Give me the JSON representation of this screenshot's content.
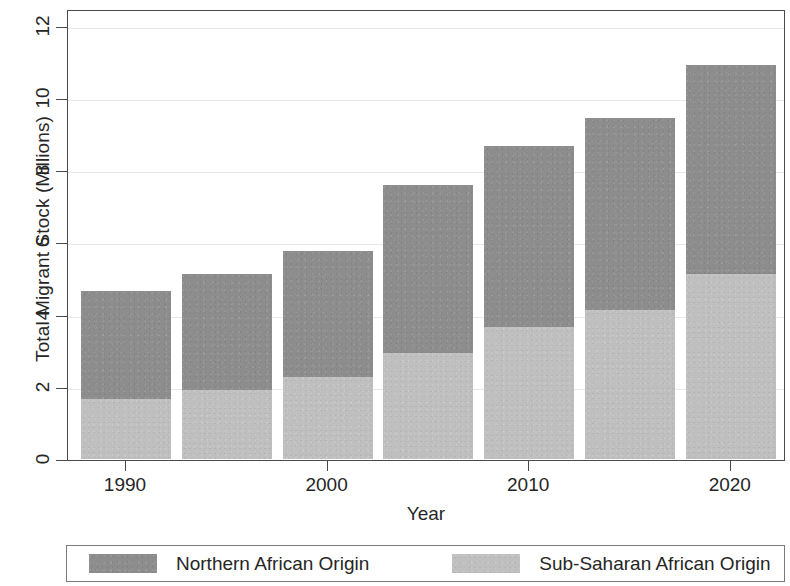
{
  "chart_data": {
    "type": "bar",
    "subtype": "stacked-bar",
    "title": "",
    "xlabel": "Year",
    "ylabel": "Total Migrant Stock (Millions)",
    "categories": [
      "1990",
      "1995",
      "2000",
      "2005",
      "2010",
      "2015",
      "2020"
    ],
    "x_tick_labels": [
      "1990",
      "2000",
      "2010",
      "2020"
    ],
    "x_tick_categories": [
      "1990",
      "2000",
      "2010",
      "2020"
    ],
    "y_tick_labels": [
      "0",
      "2",
      "4",
      "6",
      "8",
      "10",
      "12"
    ],
    "y_ticks": [
      0,
      2,
      4,
      6,
      8,
      10,
      12
    ],
    "ylim": [
      0,
      12.2
    ],
    "grid": "horizontal",
    "legend_position": "bottom",
    "series": [
      {
        "name": "Sub-Saharan African Origin",
        "color": "#bfbfbf",
        "values": [
          1.66,
          1.91,
          2.27,
          2.94,
          3.66,
          4.13,
          5.12
        ]
      },
      {
        "name": "Northern African Origin",
        "color": "#8d8d8d",
        "values": [
          2.99,
          3.21,
          3.49,
          4.65,
          5.01,
          5.31,
          5.79
        ]
      }
    ],
    "totals": [
      4.65,
      5.12,
      5.76,
      7.59,
      8.67,
      9.44,
      10.91
    ],
    "legend_entries": [
      {
        "label": "Northern African Origin",
        "color": "#8d8d8d",
        "swatch": "dark-gray-swatch"
      },
      {
        "label": "Sub-Saharan African Origin",
        "color": "#bfbfbf",
        "swatch": "light-gray-swatch"
      }
    ]
  }
}
